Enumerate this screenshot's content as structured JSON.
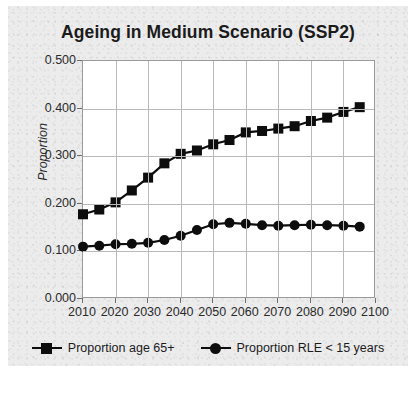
{
  "chart_data": {
    "type": "line",
    "title": "Ageing in Medium Scenario (SSP2)",
    "xlabel": "",
    "ylabel": "Proportion",
    "xlim": [
      2010,
      2100
    ],
    "ylim": [
      0.0,
      0.5
    ],
    "grid": true,
    "legend_position": "bottom",
    "x": [
      2010,
      2015,
      2020,
      2025,
      2030,
      2035,
      2040,
      2045,
      2050,
      2055,
      2060,
      2065,
      2070,
      2075,
      2080,
      2085,
      2090,
      2095
    ],
    "xticks": [
      "2010",
      "2020",
      "2030",
      "2040",
      "2050",
      "2060",
      "2070",
      "2080",
      "2090",
      "2100"
    ],
    "xtick_values": [
      2010,
      2020,
      2030,
      2040,
      2050,
      2060,
      2070,
      2080,
      2090,
      2100
    ],
    "yticks": [
      "0.000",
      "0.100",
      "0.200",
      "0.300",
      "0.400",
      "0.500"
    ],
    "ytick_values": [
      0.0,
      0.1,
      0.2,
      0.3,
      0.4,
      0.5
    ],
    "series": [
      {
        "name": "Proportion age 65+",
        "marker": "square",
        "color": "#0d0d0d",
        "values": [
          0.178,
          0.188,
          0.203,
          0.228,
          0.255,
          0.285,
          0.305,
          0.312,
          0.325,
          0.334,
          0.35,
          0.353,
          0.358,
          0.363,
          0.374,
          0.381,
          0.393,
          0.403
        ]
      },
      {
        "name": "Proportion RLE < 15 years",
        "marker": "circle",
        "color": "#0d0d0d",
        "values": [
          0.11,
          0.112,
          0.115,
          0.116,
          0.118,
          0.124,
          0.133,
          0.145,
          0.157,
          0.16,
          0.158,
          0.155,
          0.154,
          0.155,
          0.156,
          0.155,
          0.154,
          0.152
        ]
      }
    ]
  },
  "legend": {
    "entries": [
      {
        "label": "Proportion age 65+",
        "marker": "square"
      },
      {
        "label": "Proportion RLE < 15 years",
        "marker": "circle"
      }
    ]
  },
  "colors": {
    "series": "#0d0d0d",
    "grid": "#b9b9b9",
    "axis": "#9a9a9a",
    "plot_background": "#ffffff",
    "paper_background": "#ececed",
    "text": "#1b1b1b"
  }
}
